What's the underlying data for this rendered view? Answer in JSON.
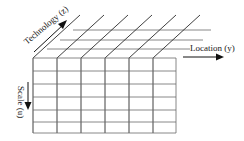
{
  "diagram": {
    "type": "3d-grid-cube",
    "colors": {
      "line": "#2a2a2a",
      "text": "#222222",
      "background": "#ffffff"
    },
    "front_face": {
      "columns": 6,
      "rows": 6
    },
    "top_face": {
      "depth_lines": 3
    },
    "axes": {
      "z": {
        "label": "Technology (z)",
        "direction": "diagonal-up-right"
      },
      "y": {
        "label": "Location (y)",
        "direction": "right"
      },
      "u": {
        "label": "Scale (u)",
        "direction": "down"
      }
    }
  }
}
